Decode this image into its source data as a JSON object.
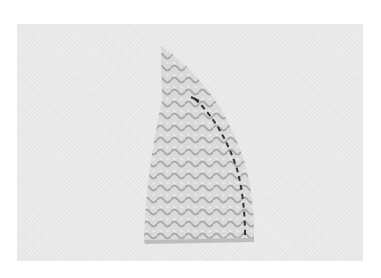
{
  "image": {
    "description": "Grayscale photo of a curved wedge-shaped fabric piece with a printed wave pattern and a dashed stitching line along its curved right edge, on a light textured background",
    "colors": {
      "background": "#ececec",
      "fabric_light": "#d6d6d6",
      "fabric_pattern": "#a8a8a8",
      "stitch_line": "#333333",
      "page": "#ffffff"
    }
  }
}
